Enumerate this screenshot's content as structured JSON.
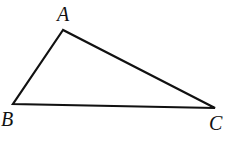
{
  "figure": {
    "kind": "geometry-diagram",
    "shape": "triangle",
    "background_color": "#ffffff",
    "stroke_color": "#111111",
    "stroke_width": 2.2,
    "canvas": {
      "width": 244,
      "height": 143
    },
    "vertices": [
      {
        "id": "A",
        "label": "A",
        "x": 63,
        "y": 30
      },
      {
        "id": "B",
        "label": "B",
        "x": 13,
        "y": 104
      },
      {
        "id": "C",
        "label": "C",
        "x": 215,
        "y": 108
      }
    ],
    "edges": [
      {
        "id": "AB",
        "from": "A",
        "to": "B"
      },
      {
        "id": "BC",
        "from": "B",
        "to": "C"
      },
      {
        "id": "CA",
        "from": "C",
        "to": "A"
      }
    ],
    "labels": {
      "A": {
        "text": "A",
        "x": 65,
        "y": 14
      },
      "B": {
        "text": "B",
        "x": 8,
        "y": 120
      },
      "C": {
        "text": "C",
        "x": 216,
        "y": 124
      }
    }
  }
}
